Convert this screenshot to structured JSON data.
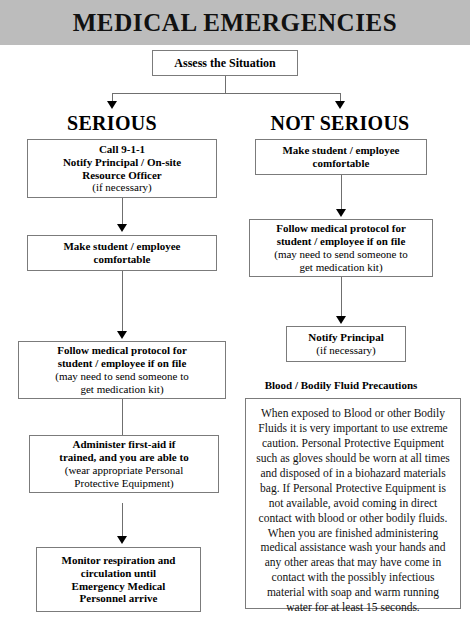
{
  "title": "MEDICAL EMERGENCIES",
  "colors": {
    "banner_background": "#bcbcbc",
    "box_border": "#7b7b7b",
    "connector": "#6f6f6f",
    "text": "#000000"
  },
  "start_node": {
    "label": "Assess the Situation"
  },
  "branches": {
    "left": {
      "heading": "SERIOUS",
      "steps": [
        {
          "bold_lines": [
            "Call 9-1-1",
            "Notify Principal / On-site",
            "Resource Officer"
          ],
          "normal_lines": [
            "(if necessary)"
          ]
        },
        {
          "bold_lines": [
            "Make student / employee",
            "comfortable"
          ],
          "normal_lines": []
        },
        {
          "bold_lines": [
            "Follow medical protocol for",
            "student / employee if on file"
          ],
          "normal_lines": [
            "(may need to send someone to",
            "get medication kit)"
          ]
        },
        {
          "bold_lines": [
            "Administer first-aid if",
            "trained, and you are able to"
          ],
          "normal_lines": [
            "(wear appropriate Personal",
            "Protective Equipment)"
          ]
        },
        {
          "bold_lines": [
            "Monitor respiration and",
            "circulation until",
            "Emergency Medical",
            "Personnel arrive"
          ],
          "normal_lines": []
        }
      ]
    },
    "right": {
      "heading": "NOT SERIOUS",
      "steps": [
        {
          "bold_lines": [
            "Make student / employee",
            "comfortable"
          ],
          "normal_lines": []
        },
        {
          "bold_lines": [
            "Follow medical protocol for",
            "student / employee if on file"
          ],
          "normal_lines": [
            "(may need to send someone to",
            "get medication kit)"
          ]
        },
        {
          "bold_lines": [
            "Notify Principal"
          ],
          "normal_lines": [
            "(if necessary)"
          ]
        }
      ]
    }
  },
  "precautions": {
    "heading": "Blood / Bodily Fluid Precautions",
    "body": "When exposed to Blood or other Bodily Fluids it is very important to use extreme caution. Personal Protective Equipment such as gloves should be worn at all times and disposed of in a biohazard materials bag. If Personal Protective Equipment is not available, avoid coming in direct contact with blood or other bodily fluids. When you are finished administering medical assistance wash your hands and any other areas that may have come in contact with the possibly infectious material with soap and warm running water for at least 15 seconds."
  }
}
